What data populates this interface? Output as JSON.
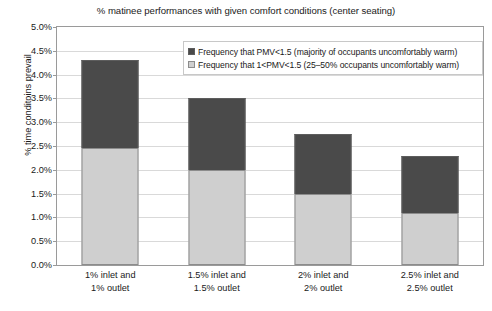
{
  "chart_data": {
    "type": "bar",
    "subtype": "stacked-bar",
    "title": "% matinee performances with given comfort conditions (center seating)",
    "xlabel": "",
    "ylabel": "% time conditoins prevail",
    "categories": [
      "1% inlet and 1% outlet",
      "1.5% inlet and 1.5% outlet",
      "2% inlet and 2% outlet",
      "2.5% inlet and 2.5% outlet"
    ],
    "category_lines": [
      [
        "1% inlet and",
        "1% outlet"
      ],
      [
        "1.5% inlet and",
        "1.5% outlet"
      ],
      [
        "2% inlet and",
        "2% outlet"
      ],
      [
        "2.5% inlet and",
        "2.5% outlet"
      ]
    ],
    "series": [
      {
        "name": "Frequency that 1<PMV<1.5 (25–50% occupants uncomfortably warm)",
        "color": "#cfcfcf",
        "values": [
          2.45,
          2.0,
          1.5,
          1.1
        ]
      },
      {
        "name": "Frequency that PMV<1.5 (majority of occupants uncomfortably warm)",
        "color": "#4a4a4a",
        "values": [
          1.85,
          1.5,
          1.25,
          1.2
        ]
      }
    ],
    "totals": [
      4.3,
      3.5,
      2.75,
      2.3
    ],
    "ylim": [
      0.0,
      5.0
    ],
    "ytick_step": 0.5,
    "ytick_labels": [
      "5.0%",
      "4.5%",
      "4.0%",
      "3.5%",
      "3.0%",
      "2.5%",
      "2.0%",
      "1.5%",
      "1.0%",
      "0.5%",
      "0.0%"
    ],
    "grid": true,
    "legend_position": "top-center"
  },
  "legend": {
    "entries": [
      {
        "label": "Frequency that PMV<1.5 (majority of occupants uncomfortably warm)",
        "swatch": "dark"
      },
      {
        "label": "Frequency that 1<PMV<1.5 (25–50% occupants uncomfortably warm)",
        "swatch": "light"
      }
    ]
  }
}
